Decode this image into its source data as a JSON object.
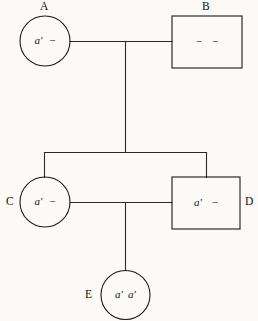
{
  "figure": {
    "type": "pedigree-chart",
    "background_color": "#fbfaf6",
    "line_color": "#2a2a2a",
    "text_color": "#101010"
  },
  "individuals": [
    {
      "id": "A",
      "label": "A",
      "symbol": "circle",
      "sex": "female",
      "generation": 1,
      "genotype": "a′ −",
      "allele1": "a",
      "allele1_prime": "′",
      "allele2": "−",
      "center_x": 45,
      "center_y": 41,
      "radius": 25
    },
    {
      "id": "B",
      "label": "B",
      "symbol": "square",
      "sex": "male",
      "generation": 1,
      "genotype": "− −",
      "allele1": "−",
      "allele2": "−",
      "x": 172,
      "y": 16,
      "width": 70,
      "height": 52
    },
    {
      "id": "C",
      "label": "C",
      "symbol": "circle",
      "sex": "female",
      "generation": 2,
      "genotype": "a′ −",
      "allele1": "a",
      "allele1_prime": "′",
      "allele2": "−",
      "center_x": 45,
      "center_y": 202,
      "radius": 25
    },
    {
      "id": "D",
      "label": "D",
      "symbol": "square",
      "sex": "male",
      "generation": 2,
      "genotype": "a′ −",
      "allele1": "a",
      "allele1_prime": "′",
      "allele2": "−",
      "x": 172,
      "y": 177,
      "width": 68,
      "height": 52
    },
    {
      "id": "E",
      "label": "E",
      "symbol": "circle",
      "sex": "female",
      "generation": 3,
      "genotype": "a′ a′",
      "allele1": "a",
      "allele1_prime": "′",
      "allele2": "a",
      "allele2_prime": "′",
      "center_x": 125,
      "center_y": 295,
      "radius": 24.5
    }
  ],
  "relationships": [
    {
      "name": "mating-A-B",
      "from": "A",
      "to": "B",
      "type": "mating-line"
    },
    {
      "name": "descent-AB-sibship",
      "from": "mating-A-B",
      "to": "sibship-line-1",
      "type": "descent-line"
    },
    {
      "name": "sibship-1",
      "members": [
        "C",
        "D"
      ],
      "type": "sibship-line"
    },
    {
      "name": "mating-C-D",
      "from": "C",
      "to": "D",
      "type": "mating-line"
    },
    {
      "name": "descent-CD-E",
      "from": "mating-C-D",
      "to": "E",
      "type": "descent-line"
    }
  ],
  "glyphs": {
    "prime": "′",
    "dash": "−"
  }
}
